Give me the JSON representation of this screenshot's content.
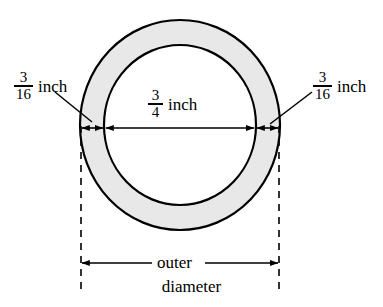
{
  "diagram": {
    "background_color": "#ffffff",
    "stroke_color": "#000000",
    "band_fill_color": "#e8e8e8",
    "inner_fill_color": "#ffffff",
    "geometry": {
      "center_x": 180,
      "center_y": 125,
      "outer_radius_x": 100,
      "outer_radius_y": 105,
      "inner_radius_x": 76,
      "inner_radius_y": 80
    },
    "labels": {
      "wall_thickness_left": {
        "numerator": "3",
        "denominator": "16",
        "unit": "inch"
      },
      "wall_thickness_right": {
        "numerator": "3",
        "denominator": "16",
        "unit": "inch"
      },
      "inner_diameter": {
        "numerator": "3",
        "denominator": "4",
        "unit": "inch"
      },
      "outer_diameter": {
        "line1": "outer",
        "line2": "diameter"
      }
    }
  }
}
